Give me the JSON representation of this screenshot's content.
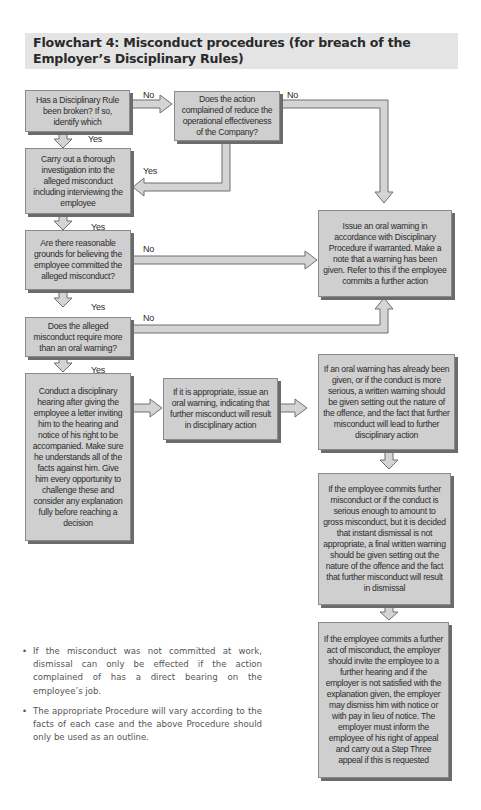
{
  "title": {
    "line1": "Flowchart 4: Misconduct procedures (for breach of the",
    "line2": "Employer’s Disciplinary Rules)"
  },
  "boxes": {
    "rule_broken": "Has a Disciplinary Rule been broken? If so, identify which",
    "reduce_effectiveness": "Does the action complained of reduce the operational effectiveness of the Company?",
    "investigation": "Carry out a thorough investigation into the alleged misconduct including interviewing the employee",
    "reasonable_grounds": "Are there reasonable grounds for believing the employee committed the alleged misconduct?",
    "more_than_oral": "Does the alleged misconduct require more than an oral warning?",
    "oral_warning": "Issue an oral warning in accordance with Disciplinary Procedure if warranted. Make a note that a warning has been given. Refer to this if the employee commits a further action",
    "hearing": "Conduct a disciplinary hearing after giving the employee a letter inviting him to the hearing and notice of his right to be accompanied. Make sure he understands all of the facts against him. Give him every opportunity to challenge these and consider any explanation fully before reaching a decision",
    "issue_oral": "If it is appropriate, issue an oral warning, indicating that further misconduct will result in disciplinary action",
    "written_warning": "If an oral warning has already been given, or if the conduct is more serious, a written warning should be given setting out the nature of the offence, and the fact that further misconduct will lead to further disciplinary action",
    "final_written": "If the employee commits further misconduct or if the conduct is serious enough to amount to gross misconduct, but it is decided that instant dismissal is not appropriate, a final written warning should be given setting out the nature of the offence and the fact that further misconduct will result in dismissal",
    "dismiss": "If the employee commits a further act of misconduct, the employer should invite the employee to a further hearing and if the employer is not satisfied with the explanation given, the employer may dismiss him with notice or with pay in lieu of notice. The employer must inform the employee of his right of appeal and carry out a Step Three appeal if this is requested"
  },
  "labels": {
    "no": "No",
    "yes": "Yes"
  },
  "notes": [
    "If the misconduct was not committed at work, dismissal can only be effected if the action complained of has a direct bearing on the employee’s job.",
    "The appropriate Procedure will vary according to the facts of each case and the above Procedure should only be used as an outline."
  ],
  "colors": {
    "box_fill": "#cfcfcf",
    "box_shadow": "#6b6b6b",
    "title_band": "#e4e4e4",
    "arrow_fill": "#d4d4d4",
    "arrow_stroke": "#6e6e6e"
  }
}
